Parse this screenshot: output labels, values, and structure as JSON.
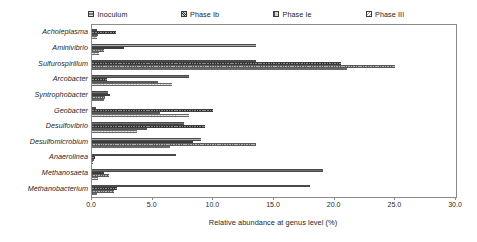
{
  "legend": {
    "position": "top",
    "items": [
      {
        "label": "Inoculum",
        "swatch": "inoculum-swatch-icon",
        "color": "#6e6e6e"
      },
      {
        "label": "Phase Ib",
        "swatch": "phase-ib-swatch-icon",
        "color": "#5e5e5e"
      },
      {
        "label": "Phase Ie",
        "swatch": "phase-ie-swatch-icon",
        "color": "#9c9c9c"
      },
      {
        "label": "Phase III",
        "swatch": "phase-iii-swatch-icon",
        "color": "#e8e8e8"
      }
    ]
  },
  "axis": {
    "x_title": "Relative abundance at genus level (%)",
    "x_ticks": [
      "0.0",
      "5.0",
      "10.0",
      "15.0",
      "20.0",
      "25.0",
      "30.0"
    ]
  },
  "chart_data": {
    "type": "bar",
    "orientation": "horizontal",
    "title": "",
    "subtitle": "",
    "xlabel": "Relative abundance at genus level (%)",
    "ylabel": "",
    "xlim": [
      0.0,
      30.0
    ],
    "xticks": [
      0.0,
      5.0,
      10.0,
      15.0,
      20.0,
      25.0,
      30.0
    ],
    "grid": false,
    "legend_position": "top",
    "categories": [
      "Acholeplasma",
      "Aminivibrio",
      "Sulfurospirillum",
      "Arcobacter",
      "Syntrophobacter",
      "Geobacter",
      "Desulfovibrio",
      "Desulfomicrobium",
      "Anaerolinea",
      "Methanosaeta",
      "Methanobacterium"
    ],
    "series": [
      {
        "name": "Inoculum",
        "values": [
          0.4,
          13.5,
          13.5,
          8.0,
          1.3,
          0.3,
          7.6,
          9.0,
          6.9,
          19.0,
          18.0
        ]
      },
      {
        "name": "Phase Ib",
        "values": [
          2.0,
          2.6,
          20.5,
          1.2,
          1.5,
          10.0,
          9.3,
          8.3,
          0.25,
          1.0,
          2.1
        ]
      },
      {
        "name": "Phase Ie",
        "values": [
          0.5,
          1.0,
          25.0,
          5.4,
          1.1,
          5.6,
          4.5,
          13.5,
          0.15,
          1.4,
          1.8
        ]
      },
      {
        "name": "Phase III",
        "values": [
          0.45,
          0.6,
          21.0,
          6.6,
          1.0,
          8.0,
          3.7,
          6.4,
          0.1,
          0.5,
          0.4
        ]
      }
    ]
  }
}
